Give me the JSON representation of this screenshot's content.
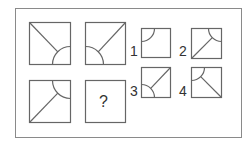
{
  "puzzle": {
    "type": "figure-matrix",
    "stroke_color": "#666666",
    "grid": [
      {
        "id": "cell-1",
        "arc_corner": "bottom-right",
        "line_from": "top-left"
      },
      {
        "id": "cell-2",
        "arc_corner": "bottom-left",
        "line_from": "top-right"
      },
      {
        "id": "cell-3",
        "arc_corner": "top-right",
        "line_from": "bottom-left"
      },
      {
        "id": "cell-4",
        "missing": true,
        "label": "?"
      }
    ],
    "options": [
      {
        "label": "1",
        "arc_corner": "top-left",
        "line_from": null
      },
      {
        "label": "2",
        "arc_corner": "top-right",
        "line_from": "bottom-left"
      },
      {
        "label": "3",
        "arc_corner": "bottom-left",
        "line_from": "top-right"
      },
      {
        "label": "4",
        "arc_corner": "top-left",
        "line_from": "bottom-right"
      }
    ]
  }
}
